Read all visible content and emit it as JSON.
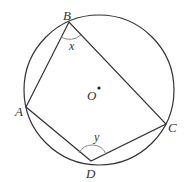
{
  "diagram": {
    "type": "cyclic-quadrilateral",
    "colors": {
      "stroke": "#333333",
      "angle_arc": "#888888",
      "background": "#ffffff"
    },
    "circle": {
      "cx": 99,
      "cy": 90,
      "r": 75
    },
    "center": {
      "label": "O",
      "x": 99,
      "y": 88
    },
    "vertices": [
      {
        "id": "A",
        "label": "A",
        "x": 26,
        "y": 107
      },
      {
        "id": "B",
        "label": "B",
        "x": 69,
        "y": 22
      },
      {
        "id": "C",
        "label": "C",
        "x": 166,
        "y": 124
      },
      {
        "id": "D",
        "label": "D",
        "x": 91,
        "y": 161
      }
    ],
    "angles": [
      {
        "at": "B",
        "label": "x"
      },
      {
        "at": "D",
        "label": "y"
      }
    ]
  }
}
